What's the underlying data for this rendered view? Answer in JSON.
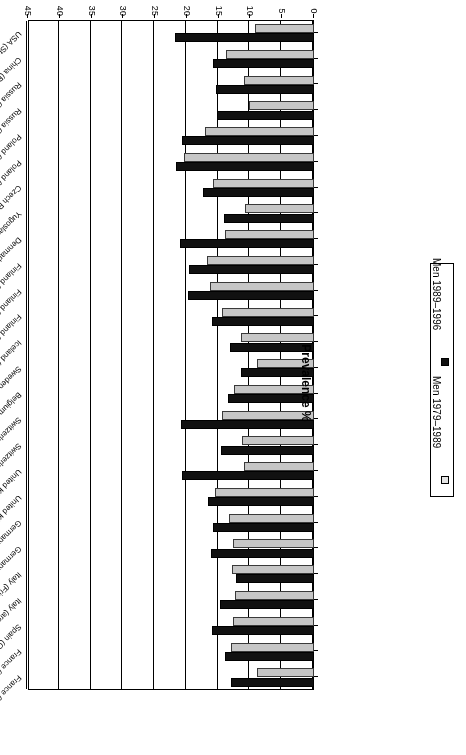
{
  "chart_data": {
    "type": "bar",
    "orientation": "horizontal",
    "title": "",
    "xlabel": "Centre",
    "ylabel": "Prevalence %",
    "axis_title_value": "Prevalence %",
    "axis_title_category": "Centre",
    "ylim": [
      0,
      45
    ],
    "ticks": [
      "0",
      "5",
      "10",
      "15",
      "20",
      "25",
      "30",
      "35",
      "40",
      "45"
    ],
    "tick_values": [
      0,
      5,
      10,
      15,
      20,
      25,
      30,
      35,
      40,
      45
    ],
    "grid": true,
    "legend_position": "right",
    "rotated_180": true,
    "categories": [
      "France (Toulouse)",
      "France (Lille)",
      "Spain (Catalonia)",
      "Italy (area Brianza)",
      "Italy (Friuli)",
      "Germany (Augsburg, urban)",
      "Germany (Augsburg, rural)",
      "United Kingdom (Belfast)",
      "United Kingdom (Glasgow)",
      "Switzerland (Ticino)",
      "Switzerland (Vaud/Fribourg)",
      "Belgium (Ghent)",
      "Sweden (North)",
      "Iceland (Iceland)",
      "Finland (Turku/Loimaa)",
      "Finland (north Karelia)",
      "Finland (Kuopio)",
      "Denmark (Glostrup)",
      "Yugoslavia (Novi Sad)",
      "Czech Republic (rural CZE)",
      "Poland (Warsaw)",
      "Poland (Tarnobrzeg)",
      "Russia (Novosibirsk)",
      "Russia (Moscow)",
      "China (Beijing)",
      "USA (Stanford)"
    ],
    "series": [
      {
        "name": "Men 1979–1989",
        "color": "#c6c6c6",
        "values": [
          9.0,
          13.0,
          12.8,
          12.5,
          12.9,
          12.8,
          13.3,
          15.6,
          11.0,
          11.3,
          14.5,
          12.6,
          9.0,
          11.5,
          14.4,
          16.3,
          16.8,
          14.0,
          10.8,
          15.9,
          20.5,
          17.2,
          10.2,
          11.0,
          13.9,
          9.3
        ]
      },
      {
        "name": "Men 1989–1996",
        "color": "#111111",
        "values": [
          13.0,
          14.0,
          16.0,
          14.8,
          12.2,
          16.2,
          15.9,
          16.6,
          20.8,
          14.6,
          20.9,
          13.5,
          11.5,
          13.2,
          16.0,
          19.9,
          19.7,
          21.1,
          14.2,
          17.5,
          21.7,
          20.7,
          15.2,
          15.4,
          15.9,
          21.8
        ]
      }
    ]
  },
  "legend": {
    "entries": [
      {
        "label": "Men 1979–1989",
        "swatch": "light"
      },
      {
        "label": "Men 1989–1996",
        "swatch": "dark"
      }
    ]
  }
}
